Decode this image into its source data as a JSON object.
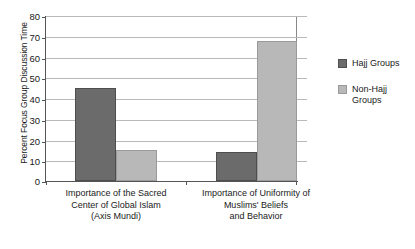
{
  "chart_data": {
    "type": "bar",
    "title": "",
    "xlabel": "",
    "ylabel": "Percent Focus Group Discussion Time",
    "ylim": [
      0,
      80
    ],
    "ytick_step": 10,
    "yticks": [
      "80",
      "70",
      "60",
      "50",
      "40",
      "30",
      "20",
      "10",
      "0"
    ],
    "grid": "horizontal",
    "legend_position": "right",
    "categories": [
      "Importance of the Sacred\nCenter of Global Islam\n(Axis Mundi)",
      "Importance of Uniformity of\nMuslims' Beliefs\nand Behavior"
    ],
    "series": [
      {
        "name": "Hajj Groups",
        "color": "#6b6b6b",
        "values": [
          45,
          14
        ]
      },
      {
        "name": "Non-Hajj\nGroups",
        "color": "#b8b8b8",
        "values": [
          15,
          68
        ]
      }
    ]
  },
  "legend": {
    "items": [
      {
        "label": "Hajj Groups"
      },
      {
        "label": "Non-Hajj\nGroups"
      }
    ]
  }
}
